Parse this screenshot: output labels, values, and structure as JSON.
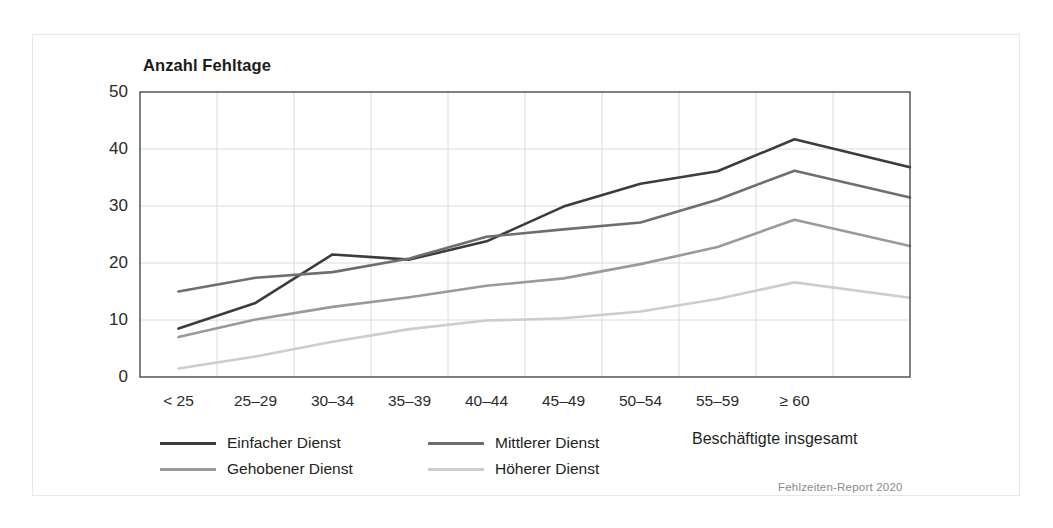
{
  "chart_data": {
    "type": "line",
    "title": "Anzahl Fehltage",
    "xlabel": "",
    "ylabel": "Anzahl Fehltage",
    "ylim": [
      0,
      50
    ],
    "yticks": [
      0,
      10,
      20,
      30,
      40,
      50
    ],
    "ytick_labels": [
      "0",
      "10",
      "20",
      "30",
      "40",
      "50"
    ],
    "grid": true,
    "legend_position": "bottom-left",
    "categories": [
      "< 25",
      "25–29",
      "30–34",
      "35–39",
      "40–44",
      "45–49",
      "50–54",
      "55–59",
      "≥ 60",
      "Beschäftigte insgesamt"
    ],
    "axis_categories": [
      "< 25",
      "25–29",
      "30–34",
      "35–39",
      "40–44",
      "45–49",
      "50–54",
      "55–59",
      "≥ 60"
    ],
    "total_category_label": "Beschäftigte insgesamt",
    "series": [
      {
        "name": "Einfacher Dienst",
        "color": "#3c3c3c",
        "values": [
          8.5,
          13.0,
          21.5,
          20.6,
          23.8,
          29.9,
          33.9,
          36.1,
          41.7,
          36.8
        ]
      },
      {
        "name": "Mittlerer Dienst",
        "color": "#6e6e6e",
        "values": [
          15.0,
          17.4,
          18.4,
          20.8,
          24.6,
          25.9,
          27.1,
          31.1,
          36.2,
          31.5
        ]
      },
      {
        "name": "Gehobener Dienst",
        "color": "#9a9a9a",
        "values": [
          7.0,
          10.1,
          12.3,
          14.0,
          16.0,
          17.3,
          19.8,
          22.8,
          27.6,
          23.0
        ]
      },
      {
        "name": "Höherer Dienst",
        "color": "#cdcdcd",
        "values": [
          1.5,
          3.6,
          6.2,
          8.4,
          9.9,
          10.3,
          11.5,
          13.7,
          16.6,
          13.9
        ]
      }
    ],
    "source": "Fehlzeiten-Report 2020"
  },
  "legend": {
    "rows": [
      [
        {
          "label": "Einfacher Dienst",
          "color": "#3c3c3c"
        },
        {
          "label": "Mittlerer Dienst",
          "color": "#6e6e6e"
        }
      ],
      [
        {
          "label": "Gehobener Dienst",
          "color": "#9a9a9a"
        },
        {
          "label": "Höherer Dienst",
          "color": "#cdcdcd"
        }
      ]
    ]
  },
  "axis_title": "Anzahl Fehltage",
  "total_label": "Beschäftigte insgesamt",
  "source_note": "Fehlzeiten-Report 2020",
  "colors": {
    "axis": "#4a4a4a",
    "grid": "#dcdcdc",
    "text": "#2b2b2b",
    "source": "#8a8a8a",
    "frame": "#e7e7e7"
  }
}
